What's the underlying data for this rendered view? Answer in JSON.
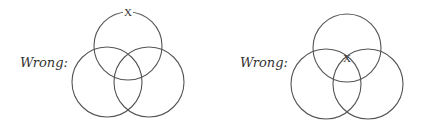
{
  "diagrams": [
    {
      "label": "Wrong:",
      "x_mark": "X",
      "x_position": "top of upper circle",
      "circles": [
        {
          "cx": 128,
          "cy": 46,
          "r": 34
        },
        {
          "cx": 107,
          "cy": 82,
          "r": 35
        },
        {
          "cx": 149,
          "cy": 82,
          "r": 35
        }
      ],
      "x_coords": {
        "x": 128,
        "y": 16
      }
    },
    {
      "label": "Wrong:",
      "x_mark": "X",
      "x_position": "central intersection",
      "circles": [
        {
          "cx": 347,
          "cy": 48,
          "r": 34
        },
        {
          "cx": 326,
          "cy": 84,
          "r": 35
        },
        {
          "cx": 368,
          "cy": 84,
          "r": 35
        }
      ],
      "x_coords": {
        "x": 347,
        "y": 62
      }
    }
  ],
  "colors": {
    "stroke": "#555555",
    "text": "#333333",
    "background": "#ffffff"
  }
}
